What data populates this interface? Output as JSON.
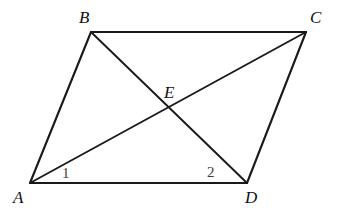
{
  "figure": {
    "kind": "geometry-diagram",
    "shape_name": "parallelogram",
    "background_color": "#ffffff",
    "stroke_color": "#1a1a1a",
    "label_color": "#111111",
    "angle_label_color": "#3d3d3d",
    "width": 337,
    "height": 216
  },
  "points": {
    "A": {
      "label": "A",
      "x": 30,
      "y": 183
    },
    "B": {
      "label": "B",
      "x": 91,
      "y": 32
    },
    "C": {
      "label": "C",
      "x": 306,
      "y": 32
    },
    "D": {
      "label": "D",
      "x": 247,
      "y": 183
    },
    "E": {
      "label": "E",
      "x": 168,
      "y": 107
    }
  },
  "edges": [
    {
      "name": "AB",
      "from": "A",
      "to": "B",
      "role": "side"
    },
    {
      "name": "BC",
      "from": "B",
      "to": "C",
      "role": "side"
    },
    {
      "name": "CD",
      "from": "C",
      "to": "D",
      "role": "side"
    },
    {
      "name": "DA",
      "from": "D",
      "to": "A",
      "role": "side"
    }
  ],
  "diagonals": [
    {
      "name": "AC",
      "from": "A",
      "to": "C",
      "role": "diagonal"
    },
    {
      "name": "BD",
      "from": "B",
      "to": "D",
      "role": "diagonal"
    }
  ],
  "angle_marks": [
    {
      "name": "angle-1",
      "label": "1",
      "at_vertex": "A",
      "between": "AC and AD",
      "x": 62,
      "y": 166
    },
    {
      "name": "angle-2",
      "label": "2",
      "at_vertex": "D",
      "between": "DB and DA",
      "x": 207,
      "y": 165
    }
  ],
  "geometry_paths": {
    "side_AB": "M 30 183 L 91 32",
    "side_BC": "M 91 32 L 306 32",
    "side_CD": "M 306 32 L 247 183",
    "side_DA": "M 247 183 L 30 183",
    "diagonal_AC": "M 30 183 L 306 32",
    "diagonal_BD": "M 91 32 L 247 183"
  }
}
